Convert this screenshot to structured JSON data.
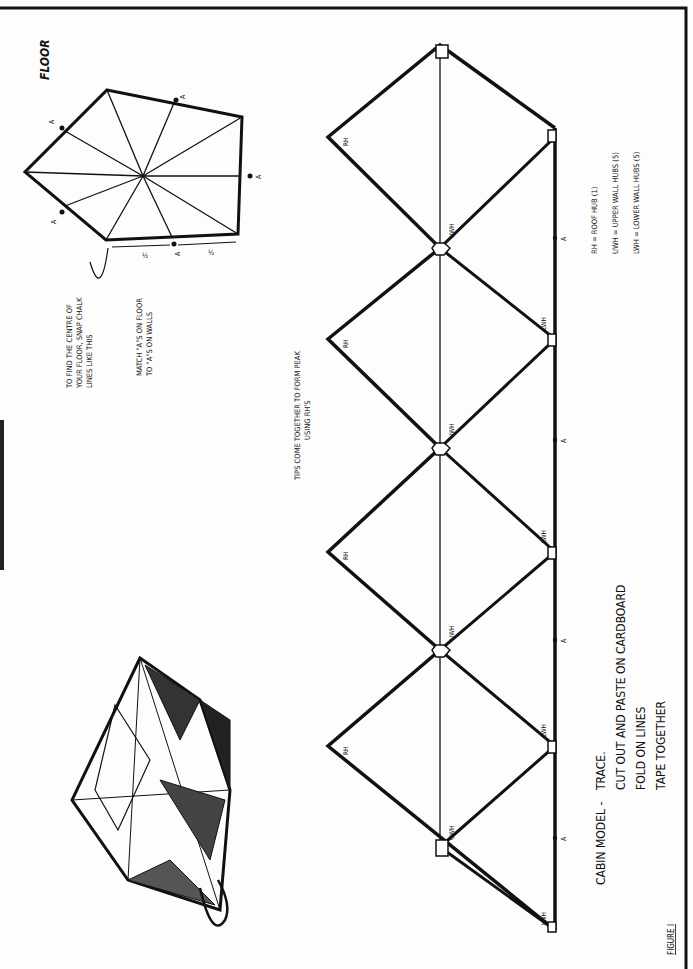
{
  "figure": {
    "label": "FIGURE I",
    "page_header_fragment": "— —"
  },
  "floor": {
    "title": "FLOOR",
    "center_note_lines": [
      "TO FIND THE CENTRE OF",
      "YOUR FLOOR, SNAP CHALK",
      "LINES LIKE THIS"
    ],
    "match_note_lines": [
      "MATCH \"A\"S ON FLOOR",
      "TO \"A\"S ON WALLS"
    ],
    "half_label": "½",
    "match_marker": "A"
  },
  "net": {
    "tips_note_lines": [
      "TIPS COME TOGETHER TO FORM PEAK",
      "USING RH'S"
    ],
    "hub_labels": {
      "roof": "RH",
      "upper": "UWH",
      "lower": "LWH"
    },
    "match_marker": "A"
  },
  "legend": {
    "items": [
      "RH = ROOF HUB (1)",
      "UWH = UPPER WALL HUBS (5)",
      "LWH = LOWER WALL HUBS (5)"
    ]
  },
  "instructions": {
    "title": "CABIN MODEL -",
    "steps": [
      "TRACE.",
      "CUT OUT AND PASTE ON CARDBOARD",
      "FOLD ON LINES",
      "TAPE TOGETHER"
    ]
  }
}
